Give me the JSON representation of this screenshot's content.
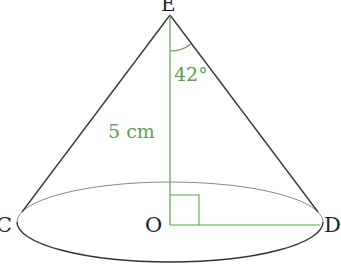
{
  "diagram": {
    "type": "cone",
    "points": {
      "apex": "E",
      "center": "O",
      "left": "C",
      "right": "D"
    },
    "height_label": "5 cm",
    "angle_label": "42°",
    "colors": {
      "outline": "#333333",
      "annotation": "#5aa24c",
      "ellipse_back": "#888888"
    }
  }
}
